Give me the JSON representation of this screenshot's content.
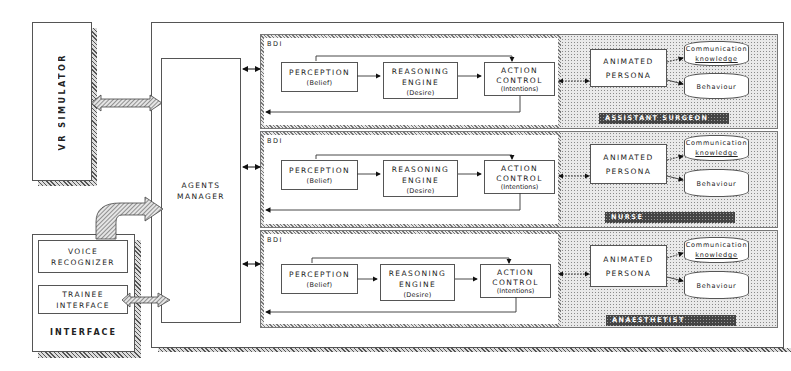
{
  "diagram": {
    "vr_simulator": {
      "label": "VR SIMULATOR"
    },
    "interface": {
      "title": "INTERFACE",
      "voice_recognizer": {
        "line1": "VOICE",
        "line2": "RECOGNIZER"
      },
      "trainee_interface": {
        "line1": "TRAINEE",
        "line2": "INTERFACE"
      }
    },
    "agents_manager": {
      "line1": "AGENTS",
      "line2": "MANAGER"
    },
    "agents": [
      {
        "bdi_label": "BDI",
        "perception": {
          "title": "PERCEPTION",
          "sub": "(Belief)"
        },
        "reasoning": {
          "line1": "REASONING",
          "line2": "ENGINE",
          "sub": "(Desire)"
        },
        "action": {
          "line1": "ACTION",
          "line2": "CONTROL",
          "sub": "(Intentions)"
        },
        "persona": {
          "line1": "ANIMATED",
          "line2": "PERSONA"
        },
        "communication": {
          "line1": "Communication",
          "line2": "knowledge"
        },
        "behaviour": "Behaviour",
        "role": "ASSISTANT SURGEON"
      },
      {
        "bdi_label": "BDI",
        "perception": {
          "title": "PERCEPTION",
          "sub": "(Belief)"
        },
        "reasoning": {
          "line1": "REASONING",
          "line2": "ENGINE",
          "sub": "(Desire)"
        },
        "action": {
          "line1": "ACTION",
          "line2": "CONTROL",
          "sub": "(Intentions)"
        },
        "persona": {
          "line1": "ANIMATED",
          "line2": "PERSONA"
        },
        "communication": {
          "line1": "Communication",
          "line2": "knowledge"
        },
        "behaviour": "Behaviour",
        "role": "NURSE"
      },
      {
        "bdi_label": "BDI",
        "perception": {
          "title": "PERCEPTION",
          "sub": "(Belief)"
        },
        "reasoning": {
          "line1": "REASONING",
          "line2": "ENGINE",
          "sub": "(Desire)"
        },
        "action": {
          "line1": "ACTION",
          "line2": "CONTROL",
          "sub": "(Intentions)"
        },
        "persona": {
          "line1": "ANIMATED",
          "line2": "PERSONA"
        },
        "communication": {
          "line1": "Communication",
          "line2": "knowledge"
        },
        "behaviour": "Behaviour",
        "role": "ANAESTHETIST"
      }
    ]
  }
}
